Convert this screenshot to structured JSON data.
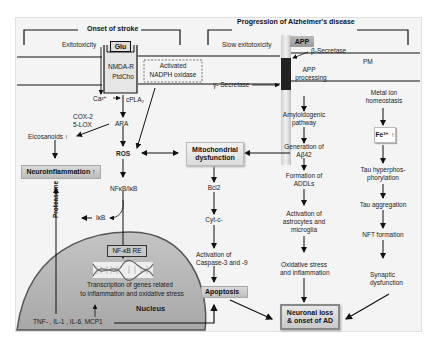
{
  "headers": {
    "stroke": "Onset of stroke",
    "alzheimers": "Progression of Alzheimer's disease"
  },
  "membrane": {
    "pm_label": "PM",
    "glu": "Glu",
    "nmda": "NMDA-R",
    "ptdcho": "PtdCho",
    "nadph_line1": "Activated",
    "nadph_line2": "NADPH oxidase",
    "app": "APP",
    "beta_secretase": "β-Secretase",
    "gamma_secretase": "γ- Secretase",
    "app_processing_line1": "APP",
    "app_processing_line2": "processing"
  },
  "stroke_path": {
    "excitotoxicity": "Exitotoxicity",
    "ca": "Ca²⁺",
    "cpla2": "cPLA₂",
    "cox2": "COX-2",
    "lox5": "5-LOX",
    "ara": "ARA",
    "eicosanoids": "Eicosanoids ↑",
    "ros": "ROS",
    "neuroinflammation": "Neuroinflammation ↑",
    "nfkb": "NFκB/IκB",
    "ikb": "IκB",
    "proteasome": "Proteasome"
  },
  "nucleus": {
    "nfkb_re": "NF-κB RE",
    "transcription_line1": "Transcription of genes related",
    "transcription_line2": "to inflammation and oxidative stress",
    "label": "Nucleus",
    "cytokines": "TNF- , IL-1 , IL-6, MCP1"
  },
  "mito_path": {
    "mito_line1": "Mitochondrial",
    "mito_line2": "dysfunction",
    "bcl2": "Bcl2",
    "cytc": "Cyt-c-",
    "caspase_line1": "Activation of",
    "caspase_line2": "Caspase-3 and -9",
    "apoptosis": "Apoptosis"
  },
  "ad_path": {
    "slow_excitotoxicity": "Slow exitotoxicity",
    "amyloid_line1": "Amyloidogenic",
    "amyloid_line2": "pathway",
    "abeta_line1": "Generation of",
    "abeta_line2": "Aβ42",
    "addl_line1": "Formation of",
    "addl_line2": "ADDLs",
    "astro_line1": "Activation of",
    "astro_line2": "astrocytes and",
    "astro_line3": "microglia",
    "ox_line1": "Oxidative stress",
    "ox_line2": "and inflammation",
    "outcome_line1": "Neuronal loss",
    "outcome_line2": "& onset of AD"
  },
  "metal_path": {
    "metal_line1": "Metal ion",
    "metal_line2": "homeostasis",
    "fe": "Fe³⁺ ↑",
    "tau_line1": "Tau  hyperphos-",
    "tau_line2": "phorylation",
    "tau_agg": "Tau aggregation",
    "nft": "NFT formation",
    "syn_line1": "Synaptic",
    "syn_line2": "dysfunction"
  }
}
